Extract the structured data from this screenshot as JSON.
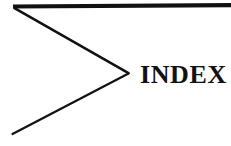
{
  "page": {
    "title": "INDEX",
    "background_color": "#ffffff",
    "ink_color": "#111111",
    "width": 231,
    "height": 146
  },
  "divider": {
    "heading_label": "INDEX",
    "graphic_name": "chevron-arrow-rule",
    "description": "Thick horizontal rule across the top with a large open chevron pointing right toward the heading",
    "elements": {
      "top_rule": {
        "name": "horizontal-rule",
        "start_x": 13,
        "start_y": 6,
        "end_x": 231,
        "end_y": 5,
        "stroke_width": 4,
        "color": "#111111"
      },
      "upper_diagonal": {
        "name": "chevron-upper-stroke",
        "start_x": 14,
        "start_y": 8,
        "end_x": 128,
        "end_y": 73,
        "stroke_width": 2.4,
        "color": "#111111"
      },
      "lower_diagonal": {
        "name": "chevron-lower-stroke",
        "start_x": 128,
        "start_y": 74,
        "end_x": 12,
        "end_y": 134,
        "stroke_width": 2.2,
        "color": "#111111"
      }
    }
  }
}
